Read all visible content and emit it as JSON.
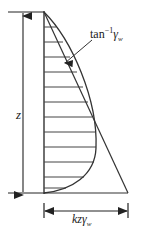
{
  "figure": {
    "stroke_color": "#222222",
    "background_color": "#ffffff",
    "depth_dimension": {
      "label": "z",
      "orientation": "vertical",
      "arrow_style": "double-headed"
    },
    "width_dimension": {
      "label_prefix": "kz",
      "label_symbol": "γ",
      "label_subscript": "w",
      "label_full": "kzγw",
      "orientation": "horizontal",
      "arrow_style": "double-headed"
    },
    "slope_annotation": {
      "prefix": "tan",
      "exponent": "−1",
      "symbol": "γ",
      "subscript": "w",
      "label_full": "tan−1γw",
      "leader": "arrow pointing down-left to curve/line intersection"
    },
    "curves": [
      {
        "name": "straight-pressure-line",
        "type": "line",
        "description": "straight line from top of axis to bottom right"
      },
      {
        "name": "curved-pressure-line",
        "type": "curve",
        "description": "curve bulging right, returning to axis at base"
      }
    ],
    "hatch_lines": {
      "name": "horizontal-tick-lines",
      "count": 12
    }
  }
}
